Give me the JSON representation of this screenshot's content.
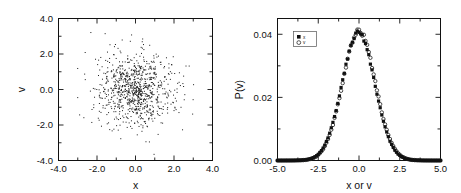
{
  "figure": {
    "background": "#ffffff",
    "ink": "#111111",
    "panel_count": 2
  },
  "chart_data": [
    {
      "type": "scatter",
      "panel": "left",
      "title": "",
      "xlabel": "x",
      "ylabel": "v",
      "xlim": [
        -4.0,
        4.0
      ],
      "ylim": [
        -4.0,
        4.0
      ],
      "xticks": [
        -4.0,
        -2.0,
        0.0,
        2.0,
        4.0
      ],
      "yticks": [
        -4.0,
        -2.0,
        0.0,
        2.0,
        4.0
      ],
      "xticklabels": [
        "-4.0",
        "-2.0",
        "0.0",
        "2.0",
        "4.0"
      ],
      "yticklabels": [
        "-4.0",
        "-2.0",
        "0.0",
        "2.0",
        "4.0"
      ],
      "minor_ticks_per_interval": 1,
      "grid": false,
      "legend": null,
      "marker": "point",
      "marker_color": "#1a1a1a",
      "marker_size": 1.0,
      "n_points": 900,
      "distribution": "bivariate-gaussian",
      "mean": [
        0.0,
        0.0
      ],
      "sigma": [
        1.0,
        1.0
      ],
      "correlation": 0.0,
      "note": "Dense isotropic Gaussian cloud of single-pixel points centered at origin"
    },
    {
      "type": "scatter",
      "panel": "right",
      "title": "",
      "xlabel": "x or v",
      "ylabel": "P(v)",
      "xlim": [
        -5.0,
        5.0
      ],
      "ylim": [
        0.0,
        0.045
      ],
      "xticks": [
        -5.0,
        -2.5,
        0.0,
        2.5,
        5.0
      ],
      "yticks": [
        0.0,
        0.02,
        0.04
      ],
      "xticklabels": [
        "-5.0",
        "-2.5",
        "0.0",
        "2.5",
        "5.0"
      ],
      "yticklabels": [
        "0.00",
        "0.02",
        "0.04"
      ],
      "minor_ticks_per_interval": 1,
      "grid": false,
      "legend_position": "upper-left-inside",
      "peak_value": 0.041,
      "peak_location": 0.0,
      "sigma": 1.0,
      "x_step": 0.1,
      "series": [
        {
          "name": "x",
          "marker": "filled-square",
          "marker_color": "#111111",
          "marker_size": 3.2,
          "amplitude": 0.0405
        },
        {
          "name": "v",
          "marker": "open-circle",
          "marker_color": "#111111",
          "marker_size": 3.4,
          "amplitude": 0.041
        }
      ]
    }
  ],
  "left_panel": {
    "axis_x_label": "x",
    "axis_y_label": "v",
    "xticklabels": [
      "-4.0",
      "-2.0",
      "0.0",
      "2.0",
      "4.0"
    ],
    "yticklabels": [
      "-4.0",
      "-2.0",
      "0.0",
      "2.0",
      "4.0"
    ]
  },
  "right_panel": {
    "axis_x_label": "x or v",
    "axis_y_label": "P(v)",
    "xticklabels": [
      "-5.0",
      "-2.5",
      "0.0",
      "2.5",
      "5.0"
    ],
    "yticklabels": [
      "0.00",
      "0.02",
      "0.04"
    ],
    "legend": {
      "entries": [
        {
          "label": "x",
          "marker": "filled-square"
        },
        {
          "label": "v",
          "marker": "open-circle"
        }
      ]
    }
  }
}
